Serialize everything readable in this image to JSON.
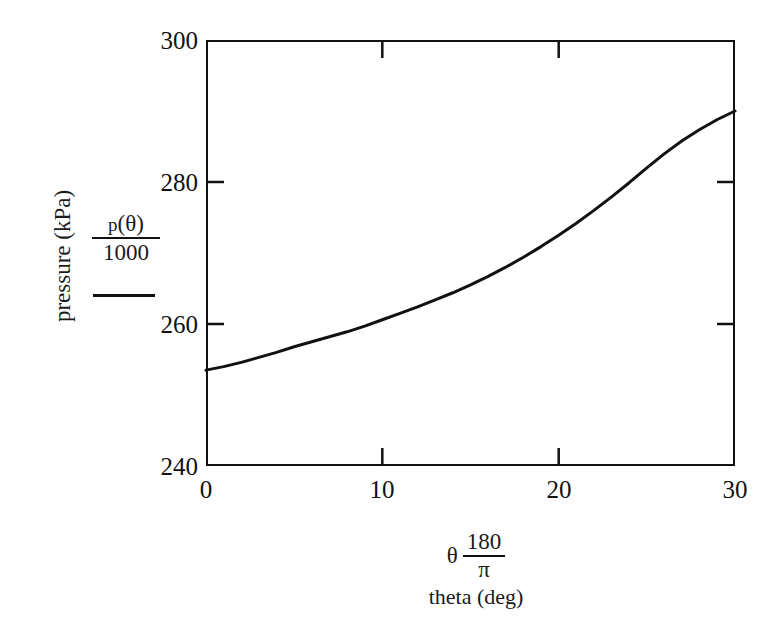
{
  "figure": {
    "background_color": "#ffffff",
    "line_color": "#111111",
    "axis_color": "#111111"
  },
  "yaxis": {
    "rotated_label": "pressure (kPa)",
    "expression_numerator_fn": "p",
    "expression_numerator_arg": "(θ)",
    "expression_denominator": "1000",
    "tick_labels": [
      "300",
      "280",
      "260",
      "240"
    ]
  },
  "xaxis": {
    "expression_symbol": "θ",
    "expression_numerator": "180",
    "expression_denominator": "π",
    "sub_label": "theta (deg)",
    "tick_labels": [
      "0",
      "10",
      "20",
      "30"
    ]
  },
  "chart_data": {
    "type": "line",
    "title": "",
    "xlabel": "theta (deg)",
    "ylabel": "pressure (kPa)",
    "xlim": [
      0,
      30
    ],
    "ylim": [
      240,
      300
    ],
    "xticks": [
      0,
      10,
      20,
      30
    ],
    "yticks": [
      240,
      260,
      280,
      300
    ],
    "grid": false,
    "legend": null,
    "series": [
      {
        "name": "p(θ)/1000",
        "x": [
          0,
          1,
          2,
          3,
          4,
          5,
          6,
          7,
          8,
          9,
          10,
          11,
          12,
          13,
          14,
          15,
          16,
          17,
          18,
          19,
          20,
          21,
          22,
          23,
          24,
          25,
          26,
          27,
          28,
          29,
          30
        ],
        "y": [
          253.5,
          254.0,
          254.6,
          255.3,
          256.0,
          256.8,
          257.5,
          258.2,
          258.9,
          259.7,
          260.6,
          261.5,
          262.4,
          263.4,
          264.4,
          265.5,
          266.7,
          268.0,
          269.4,
          270.9,
          272.5,
          274.2,
          276.0,
          277.9,
          279.9,
          282.0,
          284.0,
          285.8,
          287.4,
          288.8,
          290.0
        ]
      }
    ]
  }
}
